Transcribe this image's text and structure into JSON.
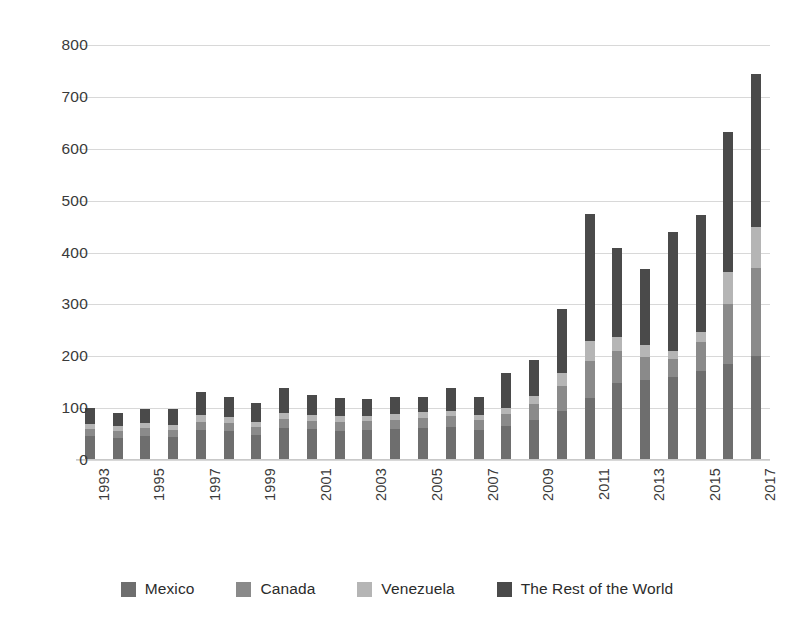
{
  "chart_data": {
    "type": "bar",
    "subtype": "stacked-vertical-bar",
    "title": "",
    "subtitle": "",
    "xlabel": "",
    "ylabel": "",
    "ylim": [
      0,
      800
    ],
    "ytick_step": 100,
    "ytick_labels": [
      "800",
      "700",
      "600",
      "500",
      "400",
      "300",
      "200",
      "100",
      "0"
    ],
    "ytick_values": [
      800,
      700,
      600,
      500,
      400,
      300,
      200,
      100,
      0
    ],
    "grid": true,
    "grid_axis": "y",
    "legend_position": "bottom-center",
    "legend_orientation": "horizontal",
    "x": [
      1993,
      1994,
      1995,
      1996,
      1997,
      1998,
      1999,
      2000,
      2001,
      2002,
      2003,
      2004,
      2005,
      2006,
      2007,
      2008,
      2009,
      2010,
      2011,
      2012,
      2013,
      2014,
      2015,
      2016,
      2017
    ],
    "categories": [
      "1993",
      "1994",
      "1995",
      "1996",
      "1997",
      "1998",
      "1999",
      "2000",
      "2001",
      "2002",
      "2003",
      "2004",
      "2005",
      "2006",
      "2007",
      "2008",
      "2009",
      "2010",
      "2011",
      "2012",
      "2013",
      "2014",
      "2015",
      "2016",
      "2017"
    ],
    "xtick_labels_shown": [
      "1993",
      "1995",
      "1997",
      "1999",
      "2001",
      "2003",
      "2005",
      "2007",
      "2009",
      "2011",
      "2013",
      "2015",
      "2017"
    ],
    "xtick_label_rotation": -90,
    "series": [
      {
        "name": "Mexico",
        "color": "#6e6e6e",
        "values": [
          46,
          42,
          46,
          44,
          58,
          55,
          48,
          62,
          59,
          56,
          57,
          59,
          62,
          64,
          58,
          66,
          78,
          95,
          120,
          148,
          155,
          160,
          172,
          186,
          200
        ]
      },
      {
        "name": "Canada",
        "color": "#8a8a8a",
        "values": [
          14,
          13,
          15,
          14,
          16,
          16,
          15,
          17,
          17,
          17,
          18,
          18,
          19,
          20,
          19,
          22,
          30,
          48,
          70,
          62,
          44,
          35,
          55,
          115,
          170
        ]
      },
      {
        "name": "Venezuela",
        "color": "#b5b5b5",
        "values": [
          10,
          10,
          10,
          10,
          12,
          11,
          10,
          12,
          11,
          11,
          10,
          11,
          11,
          11,
          10,
          12,
          16,
          25,
          40,
          28,
          22,
          16,
          20,
          62,
          80
        ]
      },
      {
        "name": "The Rest of the World",
        "color": "#4a4a4a",
        "values": [
          31,
          26,
          28,
          30,
          46,
          39,
          36,
          48,
          39,
          35,
          33,
          34,
          29,
          43,
          34,
          68,
          68,
          123,
          245,
          170,
          148,
          228,
          226,
          269,
          295
        ]
      }
    ],
    "totals": [
      101,
      91,
      99,
      98,
      132,
      121,
      109,
      139,
      126,
      119,
      118,
      122,
      121,
      138,
      121,
      168,
      192,
      291,
      475,
      408,
      369,
      439,
      473,
      632,
      745
    ],
    "stack_order_bottom_to_top": [
      "Mexico",
      "Canada",
      "Venezuela",
      "The Rest of the World"
    ]
  },
  "legend": {
    "items": [
      {
        "label": "Mexico",
        "color": "#6e6e6e"
      },
      {
        "label": "Canada",
        "color": "#8a8a8a"
      },
      {
        "label": "Venezuela",
        "color": "#b5b5b5"
      },
      {
        "label": "The Rest of the World",
        "color": "#4a4a4a"
      }
    ]
  },
  "colors": {
    "background": "#ffffff",
    "gridline": "#d8d8d8",
    "axis_text": "#3a3a3a",
    "mexico": "#6e6e6e",
    "canada": "#8a8a8a",
    "venezuela": "#b5b5b5",
    "rest_of_world": "#4a4a4a"
  }
}
